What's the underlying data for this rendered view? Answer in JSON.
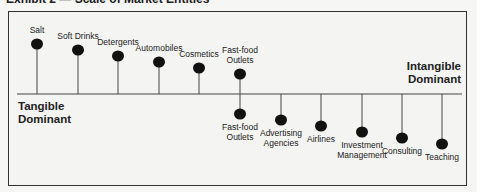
{
  "exhibit": {
    "title": "Exhibit 2 — Scale of Market Entities"
  },
  "scale": {
    "left_pole": [
      "Tangible",
      "Dominant"
    ],
    "right_pole": [
      "Intangible",
      "Dominant"
    ],
    "baseline_y": 94
  },
  "tangible_items": [
    {
      "label": [
        "Salt"
      ],
      "x": 37,
      "y": 44
    },
    {
      "label": [
        "Soft Drinks"
      ],
      "x": 78,
      "y": 50
    },
    {
      "label": [
        "Detergents"
      ],
      "x": 118,
      "y": 56
    },
    {
      "label": [
        "Automobiles"
      ],
      "x": 159,
      "y": 62
    },
    {
      "label": [
        "Cosmetics"
      ],
      "x": 199,
      "y": 68
    },
    {
      "label": [
        "Fast-food",
        "Outlets"
      ],
      "x": 240,
      "y": 74
    }
  ],
  "intangible_items": [
    {
      "label": [
        "Fast-food",
        "Outlets"
      ],
      "x": 240,
      "y": 114
    },
    {
      "label": [
        "Advertising",
        "Agencies"
      ],
      "x": 281,
      "y": 120
    },
    {
      "label": [
        "Airlines"
      ],
      "x": 321,
      "y": 126
    },
    {
      "label": [
        "Investment",
        "Management"
      ],
      "x": 362,
      "y": 132
    },
    {
      "label": [
        "Consulting"
      ],
      "x": 402,
      "y": 138
    },
    {
      "label": [
        "Teaching"
      ],
      "x": 442,
      "y": 144
    }
  ],
  "colors": {
    "ink": "#111111",
    "line": "#444444",
    "background": "#f4f4f2"
  }
}
